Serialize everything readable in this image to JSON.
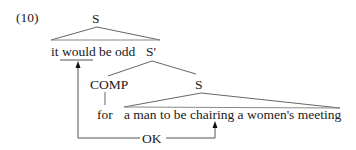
{
  "example_number": "(10)",
  "tree": {
    "root_label": "S",
    "main_clause": "it would be odd",
    "sbar_label": "S'",
    "comp_label": "COMP",
    "embedded_s_label": "S",
    "complementizer": "for",
    "embedded_clause": "a man to be chairing a women's meeting"
  },
  "relation": {
    "label": "OK",
    "from": "chairing",
    "to": "would"
  },
  "colors": {
    "text": "#1a1a1a",
    "lines": "#555555",
    "background": "#ffffff"
  }
}
